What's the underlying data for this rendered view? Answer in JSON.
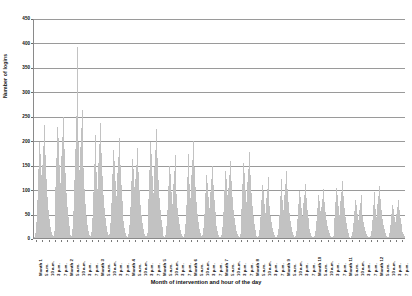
{
  "chart_data": {
    "type": "bar",
    "title": "",
    "xlabel": "Month of intervention and hour of the day",
    "ylabel": "Number of logins",
    "ylim": [
      0,
      450
    ],
    "ytick_step": 50,
    "yticks": [
      0,
      50,
      100,
      150,
      200,
      250,
      300,
      350,
      400,
      450
    ],
    "grid": true,
    "legend": false,
    "bar_color": "#c2c2c2",
    "axis_color": "#8a8a8a",
    "grid_color": "#9a9a9a",
    "text_color": "#111111",
    "months": [
      "Month 1",
      "Month 2",
      "Month 3",
      "Month 4",
      "Month 5",
      "Month 6",
      "Month 7",
      "Month 8",
      "Month 9",
      "Month 10",
      "Month 11",
      "Month 12"
    ],
    "hour_labels": [
      "5 a.m.",
      "10 a.m.",
      "3 p.m.",
      "7 p.m."
    ],
    "tick_labels_per_month": [
      "Month N",
      "5 a.m.",
      "10 a.m.",
      "3 p.m.",
      "7 p.m."
    ],
    "peak_value": 390,
    "peak_month": "Month 1",
    "monthly_peak_values": [
      390,
      250,
      245,
      243,
      238,
      232,
      205,
      200,
      175,
      150,
      148,
      140
    ],
    "monthly_typical_peak": [
      230,
      180,
      165,
      160,
      150,
      145,
      130,
      125,
      115,
      100,
      95,
      90
    ],
    "monthly_baseline": [
      60,
      48,
      45,
      42,
      40,
      38,
      33,
      30,
      28,
      24,
      22,
      20
    ],
    "values": [
      3,
      10,
      32,
      78,
      142,
      196,
      172,
      128,
      96,
      150,
      188,
      232,
      170,
      120,
      84,
      58,
      38,
      22,
      12,
      6,
      4,
      14,
      46,
      104,
      164,
      228,
      204,
      150,
      112,
      168,
      206,
      248,
      182,
      132,
      92,
      64,
      42,
      25,
      13,
      6,
      5,
      18,
      55,
      118,
      182,
      250,
      390,
      196,
      140,
      186,
      226,
      262,
      196,
      144,
      100,
      70,
      46,
      27,
      14,
      7,
      4,
      12,
      40,
      94,
      152,
      210,
      186,
      136,
      100,
      154,
      192,
      236,
      174,
      126,
      88,
      61,
      40,
      24,
      12,
      6,
      3,
      9,
      30,
      72,
      130,
      180,
      158,
      116,
      86,
      134,
      166,
      205,
      150,
      108,
      76,
      52,
      34,
      20,
      10,
      5,
      3,
      8,
      26,
      64,
      116,
      162,
      142,
      104,
      77,
      120,
      150,
      185,
      136,
      98,
      68,
      47,
      31,
      18,
      9,
      5,
      4,
      11,
      34,
      80,
      140,
      196,
      172,
      126,
      93,
      145,
      180,
      224,
      164,
      118,
      82,
      57,
      37,
      22,
      11,
      5,
      3,
      7,
      24,
      58,
      106,
      148,
      130,
      95,
      70,
      110,
      138,
      170,
      124,
      90,
      62,
      43,
      28,
      17,
      8,
      4,
      3,
      9,
      28,
      68,
      124,
      172,
      151,
      111,
      82,
      128,
      160,
      198,
      145,
      104,
      73,
      50,
      33,
      19,
      10,
      5,
      2,
      6,
      20,
      50,
      92,
      128,
      113,
      83,
      61,
      95,
      120,
      148,
      108,
      78,
      54,
      37,
      24,
      14,
      7,
      3,
      2,
      7,
      22,
      54,
      98,
      137,
      120,
      88,
      65,
      102,
      128,
      158,
      116,
      83,
      58,
      40,
      26,
      15,
      8,
      4,
      3,
      8,
      25,
      60,
      110,
      153,
      134,
      99,
      73,
      114,
      142,
      176,
      129,
      93,
      65,
      45,
      29,
      17,
      9,
      4,
      2,
      5,
      17,
      43,
      78,
      109,
      96,
      70,
      52,
      81,
      101,
      125,
      92,
      66,
      46,
      32,
      21,
      12,
      6,
      3,
      2,
      6,
      19,
      47,
      86,
      120,
      105,
      77,
      57,
      89,
      111,
      138,
      101,
      73,
      51,
      35,
      23,
      13,
      7,
      3,
      2,
      5,
      15,
      38,
      69,
      96,
      84,
      62,
      46,
      71,
      89,
      110,
      81,
      58,
      40,
      28,
      18,
      11,
      5,
      3,
      2,
      4,
      14,
      34,
      62,
      87,
      76,
      56,
      41,
      64,
      80,
      100,
      73,
      53,
      37,
      25,
      17,
      10,
      5,
      2,
      2,
      5,
      16,
      40,
      73,
      102,
      89,
      66,
      48,
      75,
      94,
      117,
      86,
      62,
      43,
      30,
      19,
      11,
      6,
      3,
      1,
      4,
      12,
      30,
      55,
      77,
      67,
      49,
      36,
      57,
      71,
      88,
      65,
      46,
      32,
      22,
      15,
      9,
      4,
      2,
      2,
      5,
      15,
      37,
      67,
      94,
      82,
      60,
      44,
      69,
      86,
      107,
      79,
      57,
      39,
      27,
      18,
      10,
      5,
      3,
      1,
      3,
      11,
      27,
      49,
      68,
      60,
      44,
      32,
      50,
      63,
      78,
      57,
      41,
      29,
      20,
      13,
      8,
      4,
      2
    ]
  }
}
